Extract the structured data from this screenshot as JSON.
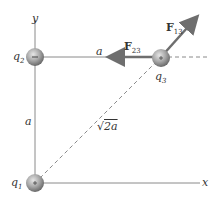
{
  "diagram": {
    "axes": {
      "x_label": "x",
      "y_label": "y"
    },
    "charges": [
      {
        "name": "q1",
        "label_base": "q",
        "label_sub": "1",
        "sign": "+"
      },
      {
        "name": "q2",
        "label_base": "q",
        "label_sub": "2",
        "sign": "−"
      },
      {
        "name": "q3",
        "label_base": "q",
        "label_sub": "3",
        "sign": "+"
      }
    ],
    "distances": {
      "top": "a",
      "left": "a",
      "diagonal_root": "√",
      "diagonal_rest": "2a"
    },
    "forces": [
      {
        "name": "F23",
        "base": "F",
        "sub": "23"
      },
      {
        "name": "F13",
        "base": "F",
        "sub": "13"
      }
    ],
    "colors": {
      "axis": "#8a8a8a",
      "arrow": "#6e6e6e",
      "charge": "#9a9a9a",
      "dash": "#8a8a8a"
    }
  }
}
